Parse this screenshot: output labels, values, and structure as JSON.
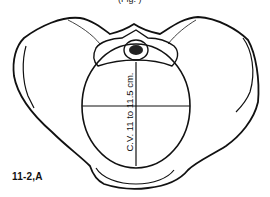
{
  "figure": {
    "label": "11-2,A",
    "top_caption_partial": "(Fig. )",
    "measurement_label": "C.V. 11 to 11.5 cm.",
    "colors": {
      "line": "#111111",
      "background": "#ffffff"
    }
  }
}
